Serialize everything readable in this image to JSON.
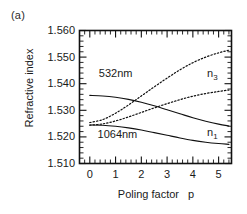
{
  "figure": {
    "panel_label": "(a)"
  },
  "chart_data": {
    "type": "line",
    "title": "",
    "xlabel": "Poling factor",
    "xvar": "p",
    "ylabel": "Refractive index",
    "xlim": [
      -0.4,
      5.5
    ],
    "ylim": [
      1.51,
      1.56
    ],
    "grid": false,
    "legend": "inline-annotations",
    "xticks": [
      0,
      1,
      2,
      3,
      4,
      5
    ],
    "xtick_labels": [
      "0",
      "1",
      "2",
      "3",
      "4",
      "5"
    ],
    "x_minor_ticks_per_interval": 5,
    "yticks": [
      1.51,
      1.52,
      1.53,
      1.54,
      1.55,
      1.56
    ],
    "ytick_labels": [
      "1.510",
      "1.520",
      "1.530",
      "1.540",
      "1.550",
      "1.560"
    ],
    "y_minor_ticks_per_interval": 5,
    "annotations": [
      {
        "text": "532nm",
        "x": 0.35,
        "y": 1.5425
      },
      {
        "text": "1064nm",
        "x": 0.3,
        "y": 1.5195
      },
      {
        "text": "n",
        "sub": "3",
        "x": 4.55,
        "y": 1.5425
      },
      {
        "text": "n",
        "sub": "1",
        "x": 4.55,
        "y": 1.5205
      }
    ],
    "series": [
      {
        "name": "n3 at 532nm",
        "label": "n_3",
        "wavelength": "532nm",
        "style": "dotted",
        "x": [
          0.0,
          0.5,
          1.0,
          1.5,
          2.0,
          2.5,
          3.0,
          3.5,
          4.0,
          4.5,
          5.0,
          5.4
        ],
        "y": [
          1.5254,
          1.5265,
          1.5289,
          1.532,
          1.5354,
          1.5388,
          1.5421,
          1.5452,
          1.5479,
          1.55,
          1.5516,
          1.5526
        ]
      },
      {
        "name": "n3 at 1064nm",
        "label": "n_3",
        "wavelength": "1064nm",
        "style": "dotted",
        "x": [
          0.0,
          0.5,
          1.0,
          1.5,
          2.0,
          2.5,
          3.0,
          3.5,
          4.0,
          4.5,
          5.0,
          5.4
        ],
        "y": [
          1.5244,
          1.5249,
          1.526,
          1.5275,
          1.5292,
          1.5309,
          1.5325,
          1.534,
          1.5353,
          1.5363,
          1.5371,
          1.5376
        ]
      },
      {
        "name": "n1 at 532nm",
        "label": "n_1",
        "wavelength": "532nm",
        "style": "solid",
        "x": [
          0.0,
          0.5,
          1.0,
          1.5,
          2.0,
          2.5,
          3.0,
          3.5,
          4.0,
          4.5,
          5.0,
          5.4
        ],
        "y": [
          1.5356,
          1.5354,
          1.5349,
          1.5341,
          1.533,
          1.5317,
          1.5302,
          1.5287,
          1.5272,
          1.5259,
          1.5248,
          1.5241
        ]
      },
      {
        "name": "n1 at 1064nm",
        "label": "n_1",
        "wavelength": "1064nm",
        "style": "solid",
        "x": [
          0.0,
          0.5,
          1.0,
          1.5,
          2.0,
          2.5,
          3.0,
          3.5,
          4.0,
          4.5,
          5.0,
          5.4
        ],
        "y": [
          1.5245,
          1.5244,
          1.524,
          1.5234,
          1.5226,
          1.5216,
          1.5206,
          1.5196,
          1.5187,
          1.518,
          1.5175,
          1.5172
        ]
      }
    ]
  }
}
